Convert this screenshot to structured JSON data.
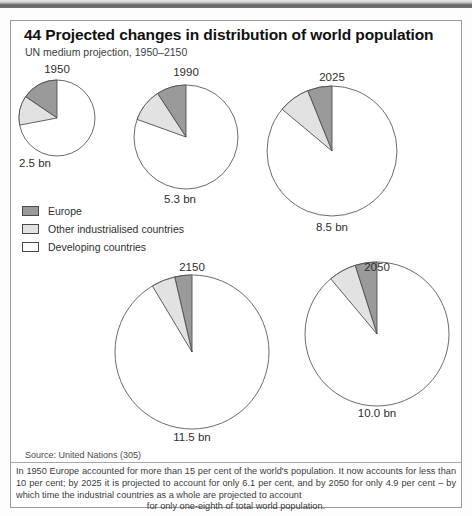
{
  "header": {
    "number": "44",
    "title": "44 Projected changes in distribution of world population",
    "subtitle": "UN medium projection, 1950–2150"
  },
  "legend": {
    "items": [
      {
        "label": "Europe",
        "color": "#9a9a9a",
        "key": "europe"
      },
      {
        "label": "Other industrialised countries",
        "color": "#e2e2e2",
        "key": "other_industrialised"
      },
      {
        "label": "Developing countries",
        "color": "#ffffff",
        "key": "developing"
      }
    ]
  },
  "source": "Source: United Nations (305)",
  "footnote": {
    "text": "In 1950 Europe accounted for more than 15 per cent of the world's population. It now accounts for less than 10 per cent; by 2025 it is projected to account for only 6.1 per cent, and by 2050 for only 4.9 per cent – by which time the industrial countries as a whole are projected to account",
    "last_line": "for only one-eighth of total world population."
  },
  "pies": [
    {
      "year": "1950",
      "total": "2.5 bn",
      "europe_pct": 15.5,
      "other_pct": 12.5,
      "developing_pct": 72.0
    },
    {
      "year": "1990",
      "total": "5.3 bn",
      "europe_pct": 9.2,
      "other_pct": 10.3,
      "developing_pct": 80.5
    },
    {
      "year": "2025",
      "total": "8.5 bn",
      "europe_pct": 6.1,
      "other_pct": 7.8,
      "developing_pct": 86.1
    },
    {
      "year": "2150",
      "total": "11.5 bn",
      "europe_pct": 3.6,
      "other_pct": 5.0,
      "developing_pct": 91.4
    },
    {
      "year": "2050",
      "total": "10.0 bn",
      "europe_pct": 4.9,
      "other_pct": 6.2,
      "developing_pct": 88.9
    }
  ],
  "chart_data": {
    "type": "pie",
    "title": "44 Projected changes in distribution of world population",
    "subtitle": "UN medium projection, 1950–2150",
    "series_labels": [
      "Europe",
      "Other industrialised countries",
      "Developing countries"
    ],
    "colors": [
      "#9a9a9a",
      "#e2e2e2",
      "#ffffff"
    ],
    "unit": "per cent of world population",
    "panels": [
      {
        "name": "1950",
        "total_population": "2.5 bn",
        "values": [
          15.5,
          12.5,
          72.0
        ]
      },
      {
        "name": "1990",
        "total_population": "5.3 bn",
        "values": [
          9.2,
          10.3,
          80.5
        ]
      },
      {
        "name": "2025",
        "total_population": "8.5 bn",
        "values": [
          6.1,
          7.8,
          86.1
        ]
      },
      {
        "name": "2150",
        "total_population": "11.5 bn",
        "values": [
          3.6,
          5.0,
          91.4
        ]
      },
      {
        "name": "2050",
        "total_population": "10.0 bn",
        "values": [
          4.9,
          6.2,
          88.9
        ]
      }
    ],
    "legend_position": "middle-left",
    "grid": false
  }
}
